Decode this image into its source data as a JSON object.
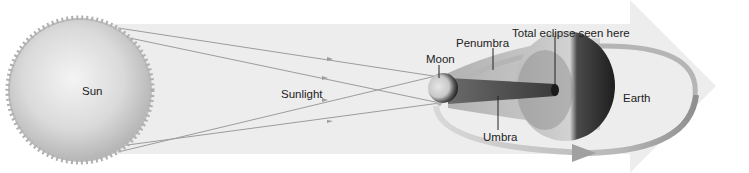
{
  "diagram": {
    "type": "solar-eclipse",
    "labels": {
      "sun": "Sun",
      "sunlight": "Sunlight",
      "moon": "Moon",
      "penumbra": "Penumbra",
      "total_eclipse": "Total eclipse seen here",
      "umbra": "Umbra",
      "earth": "Earth"
    },
    "colors": {
      "background": "#ffffff",
      "big_arrow": "#ececec",
      "sun": "#c8c8c8",
      "rays": "#9a9a9a",
      "penumbra": "#b8b8b8",
      "umbra": "#555555",
      "earth_dark": "#2a2a2a",
      "orbit": "#a8a8a8"
    }
  }
}
